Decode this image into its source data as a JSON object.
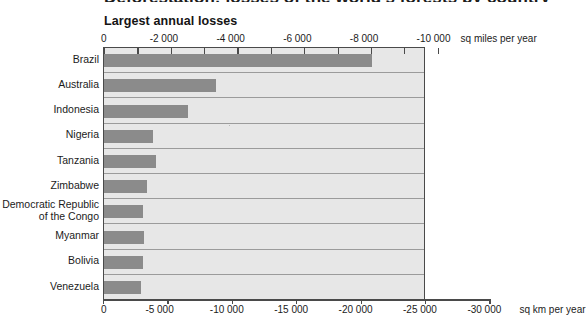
{
  "page": {
    "cut_off_headline": "Deforestation: losses of the world's forests by country"
  },
  "chart_data": {
    "type": "bar",
    "orientation": "horizontal",
    "title": "Largest annual losses",
    "categories": [
      "Brazil",
      "Australia",
      "Indonesia",
      "Nigeria",
      "Tanzania",
      "Zimbabwe",
      "Democratic Republic\nof the Congo",
      "Myanmar",
      "Bolivia",
      "Venezuela"
    ],
    "values_sq_km_per_year": [
      -20800,
      -8700,
      -6500,
      -3800,
      -4000,
      -3300,
      -3000,
      -3100,
      -3000,
      -2900
    ],
    "xlabel_top": "sq miles per year",
    "xlabel_bottom": "sq km per year",
    "xlim_sq_km": [
      0,
      -30000
    ],
    "xlim_sq_miles": [
      0,
      -10000
    ],
    "plot_extent_sq_km": [
      0,
      -25000
    ],
    "ticks_top": [
      "0",
      "-2 000",
      "-4 000",
      "-6 000",
      "-8 000",
      "-10 000"
    ],
    "ticks_bottom": [
      "0",
      "-5 000",
      "-10 000",
      "-15 000",
      "-20 000",
      "-25 000",
      "-30 000"
    ],
    "grid": "horizontal-row-separators",
    "legend": "none",
    "colors": {
      "bar": "#8b8b8b",
      "plot_background": "#e7e7e7",
      "axis": "#4a4a4a",
      "row_separator": "#9b9b9b",
      "text": "#1b1b1b"
    }
  }
}
